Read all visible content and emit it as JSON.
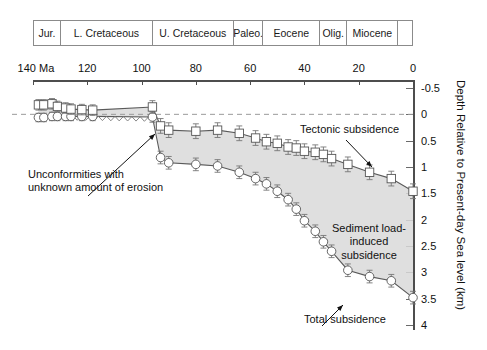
{
  "timescale": {
    "units": [
      {
        "label": "Jur.",
        "start": 140,
        "end": 130
      },
      {
        "label": "L. Cretaceous",
        "start": 130,
        "end": 96
      },
      {
        "label": "U. Cretaceous",
        "start": 96,
        "end": 66
      },
      {
        "label": "Paleo.",
        "start": 66,
        "end": 55
      },
      {
        "label": "Eocene",
        "start": 55,
        "end": 34
      },
      {
        "label": "Olig.",
        "start": 34,
        "end": 24
      },
      {
        "label": "Miocene",
        "start": 24,
        "end": 5
      },
      {
        "label": "",
        "start": 5,
        "end": 0
      }
    ]
  },
  "axes": {
    "x": {
      "label_first": "140 Ma",
      "ticks": [
        140,
        120,
        100,
        80,
        60,
        40,
        20,
        0
      ],
      "tick_labels": [
        "140 Ma",
        "120",
        "100",
        "80",
        "60",
        "40",
        "20",
        "0"
      ],
      "range": [
        140,
        0
      ],
      "unit": "Ma"
    },
    "y": {
      "title": "Depth Relative to Present-day Sea level (km)",
      "ticks": [
        -0.5,
        0,
        0.5,
        1,
        1.5,
        2,
        2.5,
        3,
        3.5,
        4
      ],
      "tick_labels": [
        "-0.5",
        "0",
        "0.5",
        "1",
        "1.5",
        "2",
        "2.5",
        "3",
        "3.5",
        "4"
      ],
      "range": [
        -0.5,
        4
      ],
      "unit": "km"
    }
  },
  "annotations": {
    "unconformities": "Unconformities with\nunknown amount of erosion",
    "tectonic": "Tectonic subsidence",
    "sediment": "Sediment load-\ninduced\nsubsidence",
    "total": "Total subsidence"
  },
  "chart_data": {
    "type": "line",
    "title": "",
    "xlabel": "Age (Ma)",
    "ylabel": "Depth Relative to Present-day Sea level (km)",
    "xlim": [
      140,
      0
    ],
    "ylim": [
      -0.5,
      4
    ],
    "y_inverted": true,
    "grid": false,
    "legend": "none",
    "zero_reference_line": 0,
    "series": [
      {
        "name": "Tectonic subsidence",
        "marker": "square",
        "x": [
          138,
          136,
          133,
          131,
          128,
          126,
          122,
          118,
          96,
          93,
          90,
          80,
          72,
          64,
          58,
          54,
          50,
          46,
          43,
          40,
          36,
          33,
          30,
          24,
          16,
          8,
          0
        ],
        "y": [
          -0.18,
          -0.18,
          -0.2,
          -0.15,
          -0.12,
          -0.1,
          -0.09,
          -0.08,
          -0.14,
          0.22,
          0.3,
          0.32,
          0.3,
          0.36,
          0.45,
          0.52,
          0.55,
          0.62,
          0.64,
          0.7,
          0.72,
          0.76,
          0.84,
          0.95,
          1.1,
          1.22,
          1.46
        ],
        "yerr": [
          0.1,
          0.1,
          0.1,
          0.1,
          0.1,
          0.1,
          0.1,
          0.1,
          0.12,
          0.14,
          0.14,
          0.14,
          0.14,
          0.14,
          0.14,
          0.14,
          0.14,
          0.14,
          0.14,
          0.14,
          0.14,
          0.14,
          0.14,
          0.14,
          0.14,
          0.14,
          0.14
        ]
      },
      {
        "name": "Total subsidence",
        "marker": "circle",
        "x": [
          138,
          136,
          133,
          131,
          128,
          126,
          122,
          118,
          96,
          93,
          90,
          80,
          72,
          64,
          58,
          54,
          50,
          46,
          43,
          40,
          36,
          33,
          30,
          24,
          16,
          8,
          0
        ],
        "y": [
          0.06,
          0.06,
          0.04,
          0.04,
          0.04,
          0.04,
          0.04,
          0.04,
          0.05,
          0.82,
          0.92,
          0.95,
          0.98,
          1.1,
          1.22,
          1.32,
          1.46,
          1.62,
          1.8,
          2.02,
          2.22,
          2.42,
          2.6,
          2.96,
          3.08,
          3.16,
          3.48
        ],
        "yerr": [
          0.08,
          0.08,
          0.08,
          0.08,
          0.08,
          0.08,
          0.08,
          0.08,
          0.1,
          0.12,
          0.12,
          0.12,
          0.12,
          0.12,
          0.12,
          0.12,
          0.12,
          0.12,
          0.12,
          0.12,
          0.12,
          0.12,
          0.12,
          0.12,
          0.12,
          0.12,
          0.12
        ]
      }
    ],
    "shaded_region": {
      "name": "Sediment load-induced subsidence",
      "between": [
        "Tectonic subsidence",
        "Total subsidence"
      ],
      "color": "#d9d9d9"
    },
    "unconformity_zone": {
      "x_start": 133,
      "x_end": 96,
      "note": "hachured/squiggle band"
    }
  },
  "colors": {
    "band": "#d9d9d9",
    "curve": "#5a5a5a",
    "marker_fill": "#ffffff",
    "marker_stroke": "#555555",
    "axis": "#4d4d4d",
    "text": "#111111",
    "zero_line": "#9a9a9a"
  }
}
